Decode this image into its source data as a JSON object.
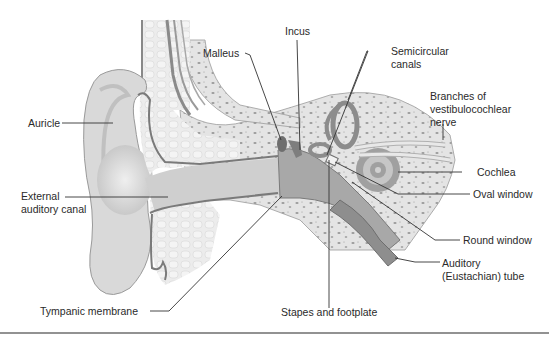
{
  "figure": {
    "colors": {
      "background": "#ffffff",
      "skin": "#dcdcdc",
      "skin_shade": "#c4c4c4",
      "cartilage": "#ebebeb",
      "bone": "#e2e2e2",
      "bone_specks": "#9a9a9a",
      "canal_wall": "#7a7a7a",
      "inner_structures": "#8c8c8c",
      "leader_lines": "#333333",
      "label_text": "#2a2a2a",
      "divider": "#6e6e6e"
    }
  },
  "labels": {
    "auricle": "Auricle",
    "external_canal_1": "External",
    "external_canal_2": "auditory canal",
    "tympanic": "Tympanic membrane",
    "malleus": "Malleus",
    "incus": "Incus",
    "semicircular_1": "Semicircular",
    "semicircular_2": "canals",
    "nerve_1": "Branches of",
    "nerve_2": "vestibulocochlear",
    "nerve_3": "nerve",
    "cochlea": "Cochlea",
    "oval_window": "Oval window",
    "round_window": "Round window",
    "auditory_tube_1": "Auditory",
    "auditory_tube_2": "(Eustachian) tube",
    "stapes": "Stapes and footplate"
  }
}
